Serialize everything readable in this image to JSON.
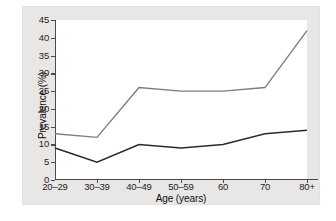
{
  "figure": {
    "background_color": "#ffffff",
    "mat_color": "#e8e7e5",
    "canvas_color": "#ffffff",
    "axis_color": "#4a4a4a"
  },
  "axes": {
    "ylabel": "Prevalence (%)",
    "xlabel": "Age (years)",
    "y_ticks": [
      "0",
      "5",
      "10",
      "15",
      "20",
      "25",
      "30",
      "35",
      "40",
      "45"
    ],
    "x_ticks": [
      "20–29",
      "30–39",
      "40–49",
      "50–59",
      "60",
      "70",
      "80+"
    ]
  },
  "chart_data": {
    "type": "line",
    "title": "",
    "xlabel": "Age (years)",
    "ylabel": "Prevalence (%)",
    "categories": [
      "20–29",
      "30–39",
      "40–49",
      "50–59",
      "60",
      "70",
      "80+"
    ],
    "series": [
      {
        "name": "upper-line",
        "color": "#7d7d7d",
        "values": [
          13,
          12,
          26,
          25,
          25,
          26,
          42
        ]
      },
      {
        "name": "lower-line",
        "color": "#2b2b2b",
        "values": [
          9,
          5,
          10,
          9,
          10,
          13,
          14
        ]
      }
    ],
    "ylim": [
      0,
      45
    ],
    "ytick_step": 5,
    "grid": false,
    "legend": "none"
  }
}
